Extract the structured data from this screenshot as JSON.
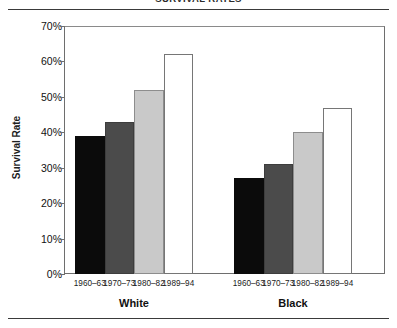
{
  "figure": {
    "clipped_caption": "SURVIVAL RATES",
    "ylabel": "Survival Rate"
  },
  "chart_data": {
    "type": "bar",
    "title": "",
    "xlabel": "",
    "ylabel": "Survival Rate",
    "ylim": [
      0,
      70
    ],
    "ytick_labels": [
      "0%",
      "10%",
      "20%",
      "30%",
      "40%",
      "50%",
      "60%",
      "70%"
    ],
    "ytick_values": [
      0,
      10,
      20,
      30,
      40,
      50,
      60,
      70
    ],
    "grid": false,
    "legend": "none",
    "categories": [
      "1960–63",
      "1970–73",
      "1980–82",
      "1989–94"
    ],
    "groups": [
      {
        "name": "White",
        "values": [
          39,
          43,
          52,
          62
        ],
        "bars": [
          {
            "label": "1960–63",
            "value": 39,
            "fill": "#0b0b0b",
            "style": "black"
          },
          {
            "label": "1970–73",
            "value": 43,
            "fill": "#4b4b4b",
            "style": "dark-gray"
          },
          {
            "label": "1980–82",
            "value": 52,
            "fill": "#c9c9c9",
            "style": "light-gray"
          },
          {
            "label": "1989–94",
            "value": 62,
            "fill": "#ffffff",
            "style": "white-outline"
          }
        ]
      },
      {
        "name": "Black",
        "values": [
          27,
          31,
          40,
          47
        ],
        "bars": [
          {
            "label": "1960–63",
            "value": 27,
            "fill": "#0b0b0b",
            "style": "black"
          },
          {
            "label": "1970–73",
            "value": 31,
            "fill": "#4b4b4b",
            "style": "dark-gray"
          },
          {
            "label": "1980–82",
            "value": 40,
            "fill": "#c9c9c9",
            "style": "light-gray"
          },
          {
            "label": "1989–94",
            "value": 47,
            "fill": "#ffffff",
            "style": "white-outline"
          }
        ]
      }
    ]
  },
  "colors": {
    "series_black": "#0b0b0b",
    "series_dark_gray": "#4b4b4b",
    "series_light_gray": "#c9c9c9",
    "series_white": "#ffffff",
    "axis": "#6e6e6e",
    "rule": "#3a3a3a"
  }
}
